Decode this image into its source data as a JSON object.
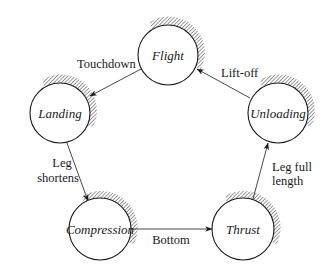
{
  "diagram": {
    "type": "state-transition-diagram",
    "states": [
      {
        "id": "flight",
        "label": "Flight",
        "cx": 168,
        "cy": 55,
        "r": 30
      },
      {
        "id": "landing",
        "label": "Landing",
        "cx": 60,
        "cy": 113,
        "r": 30
      },
      {
        "id": "unloading",
        "label": "Unloading",
        "cx": 278,
        "cy": 113,
        "r": 30
      },
      {
        "id": "compression",
        "label": "Compression",
        "cx": 100,
        "cy": 229,
        "r": 31
      },
      {
        "id": "thrust",
        "label": "Thrust",
        "cx": 243,
        "cy": 229,
        "r": 31
      }
    ],
    "transitions": [
      {
        "from": "flight",
        "to": "landing",
        "label": "Touchdown"
      },
      {
        "from": "landing",
        "to": "compression",
        "label_line1": "Leg",
        "label_line2": "shortens"
      },
      {
        "from": "compression",
        "to": "thrust",
        "label": "Bottom"
      },
      {
        "from": "thrust",
        "to": "unloading",
        "label_line1": "Leg full",
        "label_line2": "length"
      },
      {
        "from": "unloading",
        "to": "flight",
        "label": "Lift-off"
      }
    ]
  }
}
